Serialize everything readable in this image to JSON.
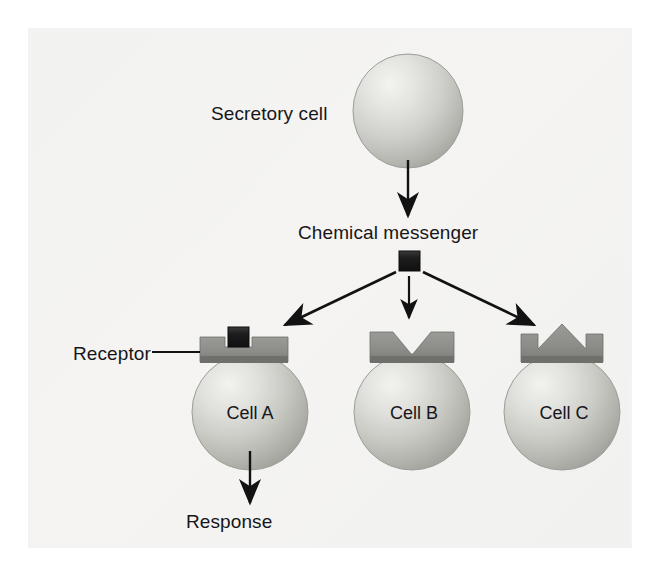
{
  "figure": {
    "background_color": "#f2f2f0",
    "page_color": "#ffffff"
  },
  "labels": {
    "secretory_cell": "Secretory cell",
    "chemical_messenger": "Chemical messenger",
    "receptor": "Receptor",
    "response": "Response"
  },
  "cells": [
    {
      "id": "cell-a",
      "label": "Cell A",
      "receptor_shape": "square-slot",
      "messenger_bound": true,
      "responds": true
    },
    {
      "id": "cell-b",
      "label": "Cell B",
      "receptor_shape": "v-notch",
      "messenger_bound": false,
      "responds": false
    },
    {
      "id": "cell-c",
      "label": "Cell C",
      "receptor_shape": "crown-peak",
      "messenger_bound": false,
      "responds": false
    }
  ],
  "messenger": {
    "shape": "square",
    "color": "#1b1b1b"
  },
  "colors": {
    "cell_fill_light": "#ededea",
    "cell_fill_mid": "#c9c9c5",
    "cell_fill_dark": "#a9a9a4",
    "receptor_gray": "#8e8e8a",
    "receptor_gray_dark": "#70706c",
    "arrow_black": "#121212",
    "text": "#16161a"
  },
  "arrows": [
    {
      "name": "secretion-arrow",
      "from": "secretory-cell",
      "to": "chemical-messenger",
      "direction": "down"
    },
    {
      "name": "messenger-to-cell-a",
      "from": "chemical-messenger",
      "to": "cell-a",
      "direction": "down-left"
    },
    {
      "name": "messenger-to-cell-b",
      "from": "chemical-messenger",
      "to": "cell-b",
      "direction": "down"
    },
    {
      "name": "messenger-to-cell-c",
      "from": "chemical-messenger",
      "to": "cell-c",
      "direction": "down-right"
    },
    {
      "name": "response-arrow",
      "from": "cell-a",
      "to": "response",
      "direction": "down"
    }
  ],
  "leader_lines": [
    {
      "name": "receptor-leader",
      "from": "receptor-label",
      "to": "cell-a-receptor"
    }
  ]
}
